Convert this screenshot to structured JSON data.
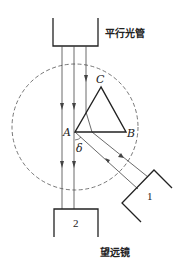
{
  "diagram": {
    "collimator_label": "平行光管",
    "telescope_label": "望远镜",
    "vertex_a": "A",
    "vertex_b": "B",
    "vertex_c": "C",
    "angle_label": "δ",
    "mirror_label": "1",
    "telescope_number": "2",
    "colors": {
      "line": "#222222",
      "dashed": "#555555",
      "ray": "#444444"
    }
  }
}
